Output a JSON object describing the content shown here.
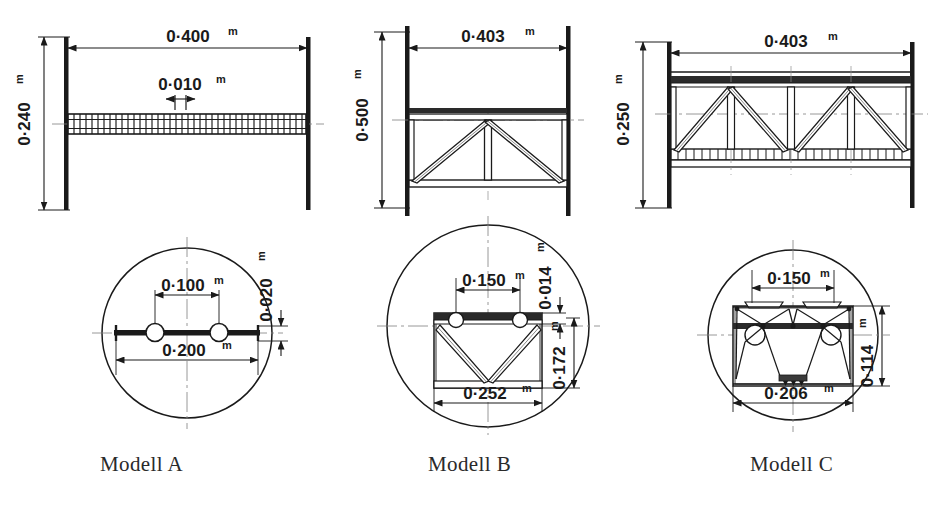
{
  "figure": {
    "kind": "engineering-drawing",
    "unit_suffix": "m",
    "line_color": "#1a1a1a",
    "background": "#ffffff"
  },
  "models": [
    {
      "id": "A",
      "label": "Modell A",
      "elevation": {
        "span": "0·400",
        "span_unit": "m",
        "height": "0·240",
        "height_unit": "m",
        "deck_thickness": "0·010",
        "deck_thickness_unit": "m",
        "deck_type": "gridded-plate"
      },
      "section": {
        "inner_width": "0·100",
        "inner_width_unit": "m",
        "outer_width": "0·200",
        "outer_width_unit": "m",
        "depth": "0·020",
        "depth_unit": "m",
        "features": "flat plate with two tubes"
      }
    },
    {
      "id": "B",
      "label": "Modell B",
      "elevation": {
        "span": "0·403",
        "span_unit": "m",
        "height": "0·500",
        "height_unit": "m",
        "truss_type": "single-bay V truss with centre post"
      },
      "section": {
        "top_width": "0·150",
        "top_width_unit": "m",
        "top_thickness": "0·014",
        "top_thickness_unit": "m",
        "depth": "0·172",
        "depth_unit": "m",
        "bottom_width": "0·252",
        "bottom_width_unit": "m",
        "features": "box with V bracing and two tubes"
      }
    },
    {
      "id": "C",
      "label": "Modell C",
      "elevation": {
        "span": "0·403",
        "span_unit": "m",
        "height": "0·250",
        "height_unit": "m",
        "truss_type": "two-bay Warren truss with verticals, ladder bottom chord"
      },
      "section": {
        "top_width": "0·150",
        "top_width_unit": "m",
        "depth": "0·114",
        "depth_unit": "m",
        "bottom_width": "0·206",
        "bottom_width_unit": "m",
        "features": "box with zigzag top truss, two tubes, V bracing to bottom centre"
      }
    }
  ]
}
